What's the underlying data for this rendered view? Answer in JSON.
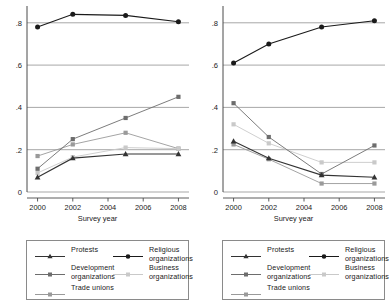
{
  "figure": {
    "panels": [
      "left",
      "right"
    ]
  },
  "axes": {
    "xlabel": "Survey year",
    "xticks": [
      "2000",
      "2002",
      "2004",
      "2006",
      "2008"
    ],
    "xtick_values": [
      2000,
      2002,
      2004,
      2006,
      2008
    ],
    "yticks": [
      "0",
      ".2",
      ".4",
      ".6",
      ".8"
    ],
    "ytick_values": [
      0,
      0.2,
      0.4,
      0.6,
      0.8
    ],
    "xlim": [
      1999.4,
      2008.6
    ],
    "ylim": [
      0,
      0.87
    ],
    "grid": "horizontal"
  },
  "legend": {
    "position": "below-each-panel",
    "items": [
      {
        "label": "Protests",
        "marker": "triangle",
        "color": "#333333"
      },
      {
        "label": "Religious\norganizations",
        "marker": "circle",
        "color": "#1a1a1a"
      },
      {
        "label": "Development\norganizations",
        "marker": "square",
        "color": "#6d6d6d"
      },
      {
        "label": "Business\norganizations",
        "marker": "square",
        "color": "#c9c9c9"
      },
      {
        "label": "Trade unions",
        "marker": "square",
        "color": "#9a9a9a"
      }
    ]
  },
  "chart_data": [
    {
      "type": "line",
      "title": "",
      "panel": "left",
      "xlabel": "Survey year",
      "ylabel": "",
      "x": [
        2000,
        2002,
        2005,
        2008
      ],
      "xlim": [
        1999.4,
        2008.6
      ],
      "ylim": [
        0,
        0.87
      ],
      "grid": true,
      "series": [
        {
          "name": "Protests",
          "marker": "triangle",
          "color": "#333333",
          "values": [
            0.07,
            0.16,
            0.18,
            0.18
          ]
        },
        {
          "name": "Religious organizations",
          "marker": "circle",
          "color": "#1a1a1a",
          "values": [
            0.78,
            0.84,
            0.835,
            0.805
          ]
        },
        {
          "name": "Development organizations",
          "marker": "square",
          "color": "#6d6d6d",
          "values": [
            0.11,
            0.25,
            0.35,
            0.45
          ]
        },
        {
          "name": "Business organizations",
          "marker": "square",
          "color": "#c9c9c9",
          "values": [
            0.09,
            0.165,
            0.21,
            0.205
          ]
        },
        {
          "name": "Trade unions",
          "marker": "square",
          "color": "#9a9a9a",
          "values": [
            0.17,
            0.225,
            0.28,
            0.205
          ]
        }
      ]
    },
    {
      "type": "line",
      "title": "",
      "panel": "right",
      "xlabel": "Survey year",
      "ylabel": "",
      "x": [
        2000,
        2002,
        2005,
        2008
      ],
      "xlim": [
        1999.4,
        2008.6
      ],
      "ylim": [
        0,
        0.87
      ],
      "grid": true,
      "series": [
        {
          "name": "Protests",
          "marker": "triangle",
          "color": "#333333",
          "values": [
            0.24,
            0.16,
            0.08,
            0.07
          ]
        },
        {
          "name": "Religious organizations",
          "marker": "circle",
          "color": "#1a1a1a",
          "values": [
            0.61,
            0.7,
            0.78,
            0.81
          ]
        },
        {
          "name": "Development organizations",
          "marker": "square",
          "color": "#6d6d6d",
          "values": [
            0.42,
            0.26,
            0.085,
            0.22
          ]
        },
        {
          "name": "Business organizations",
          "marker": "square",
          "color": "#c9c9c9",
          "values": [
            0.32,
            0.23,
            0.14,
            0.14
          ]
        },
        {
          "name": "Trade unions",
          "marker": "square",
          "color": "#9a9a9a",
          "values": [
            0.225,
            0.155,
            0.04,
            0.04
          ]
        }
      ]
    }
  ]
}
